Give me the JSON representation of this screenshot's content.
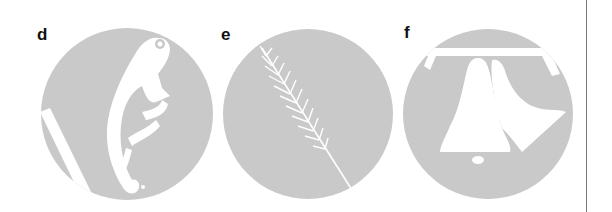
{
  "figure": {
    "panels": [
      {
        "label": "d",
        "subject": "chameleon-silhouette-icon",
        "label_pos": [
          37,
          26
        ],
        "center": [
          127,
          114
        ],
        "radius": 86
      },
      {
        "label": "e",
        "subject": "wheat-ear-silhouette-icon",
        "label_pos": [
          221,
          26
        ],
        "center": [
          308,
          114
        ],
        "radius": 85
      },
      {
        "label": "f",
        "subject": "bells-silhouette-icon",
        "label_pos": [
          402,
          24
        ],
        "center": [
          488,
          114
        ],
        "radius": 85
      }
    ],
    "colors": {
      "circle_fill": "#c9c9c9",
      "silhouette": "#ffffff",
      "label": "#111111",
      "divider": "#777777"
    }
  }
}
